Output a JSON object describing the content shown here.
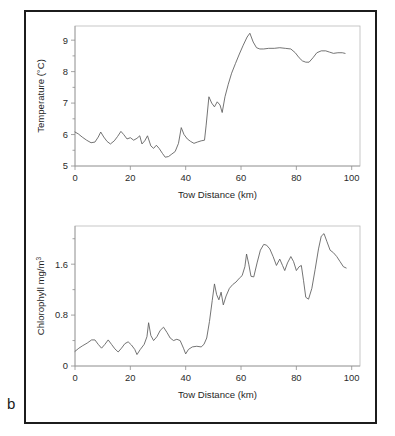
{
  "figure": {
    "panel_letter": "b",
    "background_color": "#ffffff",
    "border_color": "#1c1c1c",
    "line_color": "#5b5b5b",
    "axis_color": "#9a9a9a"
  },
  "chart_data": [
    {
      "id": "temperature",
      "type": "line",
      "title": "",
      "xlabel": "Tow Distance (km)",
      "ylabel": "Temperature (°C)",
      "ylabel_parts": {
        "main": "Temperature (°C)"
      },
      "xlim": [
        0,
        103
      ],
      "ylim": [
        5,
        9.45
      ],
      "xticks": [
        0,
        20,
        40,
        60,
        80,
        100
      ],
      "xticklabels": [
        "0",
        "20",
        "40",
        "60",
        "80",
        "100"
      ],
      "yticks": [
        5,
        6,
        7,
        8,
        9
      ],
      "yticklabels": [
        "5",
        "6",
        "7",
        "8",
        "9"
      ],
      "yminorticks": [
        5.5,
        6.5,
        7.5,
        8.5
      ],
      "grid": false,
      "legend": "none",
      "x": [
        0,
        1.2,
        2.6,
        4.2,
        5.8,
        7.2,
        8.4,
        9.3,
        10.4,
        11.6,
        12.8,
        14.2,
        15.4,
        16.6,
        17.6,
        18.8,
        20.0,
        21.2,
        22.4,
        23.4,
        24.2,
        25.2,
        26.2,
        27.4,
        28.4,
        29.4,
        30.4,
        31.6,
        32.6,
        33.8,
        35.0,
        36.2,
        37.4,
        38.4,
        39.4,
        40.6,
        41.8,
        43.0,
        44.2,
        45.6,
        46.8,
        47.4,
        48.4,
        49.4,
        50.4,
        51.4,
        52.4,
        53.2,
        54.2,
        55.4,
        56.6,
        58.0,
        59.4,
        60.8,
        62.2,
        63.2,
        64.4,
        65.6,
        66.8,
        68.2,
        70.0,
        72.0,
        74.0,
        76.0,
        78.0,
        79.6,
        81.0,
        82.2,
        83.4,
        84.6,
        86.0,
        87.4,
        89.0,
        90.6,
        92.0,
        93.4,
        95.0,
        96.6,
        97.6
      ],
      "y": [
        6.08,
        6.02,
        5.92,
        5.82,
        5.74,
        5.76,
        5.92,
        6.08,
        5.92,
        5.78,
        5.7,
        5.8,
        5.94,
        6.1,
        6.0,
        5.86,
        5.9,
        5.82,
        5.88,
        5.96,
        5.7,
        5.8,
        5.96,
        5.64,
        5.56,
        5.66,
        5.56,
        5.4,
        5.28,
        5.3,
        5.38,
        5.46,
        5.72,
        6.22,
        6.0,
        5.86,
        5.78,
        5.72,
        5.76,
        5.8,
        5.82,
        6.3,
        7.2,
        7.0,
        6.88,
        7.04,
        6.94,
        6.7,
        7.2,
        7.6,
        7.95,
        8.26,
        8.56,
        8.84,
        9.1,
        9.22,
        8.94,
        8.76,
        8.72,
        8.72,
        8.74,
        8.74,
        8.76,
        8.74,
        8.72,
        8.6,
        8.44,
        8.34,
        8.3,
        8.3,
        8.44,
        8.6,
        8.66,
        8.66,
        8.62,
        8.58,
        8.6,
        8.6,
        8.58
      ]
    },
    {
      "id": "chlorophyll",
      "type": "line",
      "title": "",
      "xlabel": "Tow Distance (km)",
      "ylabel": "Chlorophyll mg/m3",
      "ylabel_parts": {
        "main": "Chlorophyll mg/m",
        "sup": "3"
      },
      "xlim": [
        0,
        103
      ],
      "ylim": [
        0,
        2.2
      ],
      "xticks": [
        0,
        20,
        40,
        60,
        80,
        100
      ],
      "xticklabels": [
        "0",
        "20",
        "40",
        "60",
        "80",
        "100"
      ],
      "yticks": [
        0,
        0.8,
        1.6
      ],
      "yticklabels": [
        "0",
        "0.8",
        "1.6"
      ],
      "yminorticks": [
        0.4,
        1.2,
        2.0
      ],
      "grid": false,
      "legend": "none",
      "x": [
        0,
        1.4,
        2.8,
        4.4,
        6.0,
        7.2,
        8.4,
        9.6,
        10.8,
        12.0,
        13.2,
        14.4,
        15.6,
        16.8,
        18.0,
        19.2,
        20.4,
        21.6,
        22.4,
        23.6,
        25.0,
        26.0,
        26.6,
        27.4,
        28.4,
        29.6,
        30.8,
        32.0,
        33.2,
        34.4,
        35.6,
        36.8,
        38.0,
        39.2,
        40.0,
        41.0,
        42.4,
        44.0,
        45.6,
        46.6,
        47.6,
        48.6,
        49.6,
        50.4,
        51.2,
        52.0,
        52.8,
        53.6,
        54.6,
        55.8,
        57.0,
        58.2,
        59.4,
        60.4,
        61.4,
        62.0,
        62.8,
        63.6,
        64.6,
        65.8,
        67.0,
        68.2,
        69.2,
        70.4,
        71.6,
        72.8,
        74.0,
        75.0,
        75.8,
        76.8,
        78.0,
        79.0,
        80.0,
        81.0,
        81.8,
        82.6,
        83.4,
        84.4,
        85.6,
        86.8,
        88.0,
        89.0,
        90.0,
        91.0,
        92.2,
        93.4,
        94.6,
        95.8,
        97.0,
        98.0
      ],
      "y": [
        0.23,
        0.28,
        0.32,
        0.36,
        0.41,
        0.41,
        0.34,
        0.28,
        0.34,
        0.41,
        0.34,
        0.27,
        0.22,
        0.28,
        0.35,
        0.38,
        0.33,
        0.26,
        0.18,
        0.26,
        0.34,
        0.46,
        0.68,
        0.48,
        0.4,
        0.46,
        0.56,
        0.61,
        0.53,
        0.44,
        0.4,
        0.42,
        0.4,
        0.28,
        0.19,
        0.26,
        0.3,
        0.31,
        0.3,
        0.34,
        0.44,
        0.7,
        1.03,
        1.29,
        1.12,
        1.04,
        1.16,
        0.96,
        1.1,
        1.22,
        1.28,
        1.32,
        1.38,
        1.42,
        1.56,
        1.76,
        1.6,
        1.41,
        1.4,
        1.62,
        1.82,
        1.91,
        1.9,
        1.84,
        1.72,
        1.58,
        1.68,
        1.58,
        1.5,
        1.62,
        1.72,
        1.64,
        1.5,
        1.56,
        1.58,
        1.34,
        1.08,
        1.05,
        1.22,
        1.52,
        1.84,
        2.04,
        2.08,
        1.96,
        1.82,
        1.78,
        1.72,
        1.64,
        1.56,
        1.54
      ]
    }
  ]
}
